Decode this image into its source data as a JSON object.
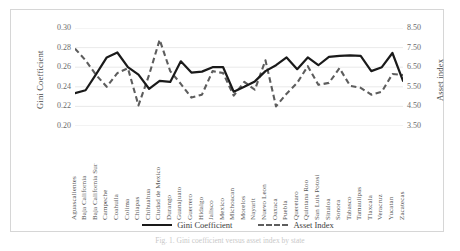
{
  "figure": {
    "caption": "Fig. 1. Gini coefficient versus asset index by state"
  },
  "axes": {
    "left_title": "Gini Coefficient",
    "right_title": "Asset index",
    "left_ticks": [
      "0.30",
      "0.28",
      "0.26",
      "0.24",
      "0.22",
      "0.20"
    ],
    "right_ticks": [
      "8.50",
      "7.50",
      "6.50",
      "5.50",
      "4.50",
      "3.50"
    ]
  },
  "legend": {
    "items": [
      {
        "label": "Gini Coefficient",
        "style": "solid",
        "color": "#1a1a1a"
      },
      {
        "label": "Asset Index",
        "style": "dashed",
        "color": "#5d5d5d"
      }
    ]
  },
  "chart_data": {
    "type": "line",
    "title": "",
    "xlabel": "",
    "ylabel": "Gini Coefficient",
    "y2label": "Asset index",
    "ylim": [
      0.2,
      0.3
    ],
    "y2lim": [
      3.5,
      8.5
    ],
    "ytick_step": 0.02,
    "y2tick_step": 1.0,
    "grid": true,
    "legend_position": "bottom",
    "categories": [
      "Aguascalientes",
      "Baja California",
      "Baja California Sur",
      "Campeche",
      "Coahuila",
      "Colima",
      "Chiapas",
      "Chihuahua",
      "Ciudad de Mexico",
      "Durango",
      "Guanajuato",
      "Guerrero",
      "Hidalgo",
      "Jalisco",
      "Mexico",
      "Michoacan",
      "Morelos",
      "Nayarit",
      "Nuevo Leon",
      "Oaxaca",
      "Puebla",
      "Queretaro",
      "Quintana Roo",
      "San Luis Potosi",
      "Sinaloa",
      "Sonora",
      "Tabasco",
      "Tamaulipas",
      "Tlaxcala",
      "Veracruz",
      "Yucatan",
      "Zacatecas"
    ],
    "series": [
      {
        "name": "Gini Coefficient",
        "axis": "left",
        "style": "solid",
        "color": "#1a1a1a",
        "values": [
          0.2335,
          0.2365,
          0.253,
          0.27,
          0.275,
          0.26,
          0.2525,
          0.238,
          0.246,
          0.245,
          0.266,
          0.2545,
          0.2555,
          0.26,
          0.26,
          0.235,
          0.24,
          0.2455,
          0.256,
          0.262,
          0.27,
          0.258,
          0.27,
          0.262,
          0.2705,
          0.2715,
          0.272,
          0.2715,
          0.256,
          0.26,
          0.2745,
          0.246
        ]
      },
      {
        "name": "Asset Index",
        "axis": "right",
        "style": "dashed",
        "color": "#5d5d5d",
        "values": [
          7.45,
          6.85,
          6.1,
          5.5,
          6.2,
          6.45,
          4.55,
          6.1,
          7.9,
          6.3,
          5.65,
          4.95,
          5.1,
          6.3,
          6.2,
          5.05,
          5.75,
          5.35,
          6.85,
          4.5,
          5.15,
          5.7,
          6.55,
          5.6,
          5.7,
          6.45,
          5.55,
          5.45,
          5.1,
          5.25,
          6.15,
          6.1
        ]
      }
    ]
  }
}
